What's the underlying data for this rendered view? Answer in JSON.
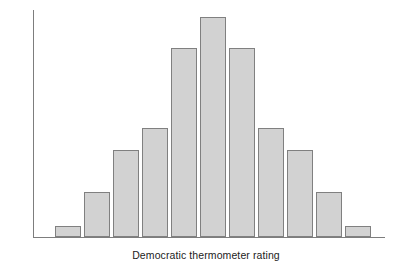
{
  "chart_data": {
    "type": "bar",
    "title": "",
    "subtitle": "",
    "xlabel": "Democratic thermometer rating",
    "ylabel": "",
    "categories": [
      "1",
      "2",
      "3",
      "4",
      "5",
      "6",
      "7",
      "8",
      "9",
      "10",
      "11"
    ],
    "values": [
      11,
      45,
      87,
      109,
      189,
      220,
      189,
      109,
      87,
      45,
      11
    ],
    "series": [
      {
        "name": "Frequency",
        "values": [
          11,
          45,
          87,
          109,
          189,
          220,
          189,
          109,
          87,
          45,
          11
        ]
      }
    ],
    "ylim": [
      0,
      227
    ],
    "xlim": [
      0,
      11
    ],
    "grid": false,
    "legend": null,
    "legend_position": "none",
    "tick_labels": {
      "x": [],
      "y": []
    },
    "annotations": [],
    "bar_fill_color": "#d2d2d2",
    "bar_border_color": "#808080",
    "axis_color": "#7d7d7d",
    "background_color": "#ffffff",
    "text_color": "#1c1c1c"
  },
  "layout": {
    "plot_left": 33,
    "plot_baseline": 237,
    "plot_top": 10,
    "axis_right": 385,
    "bar_width": 26,
    "bar_pitch": 29,
    "first_bar_left": 55
  }
}
